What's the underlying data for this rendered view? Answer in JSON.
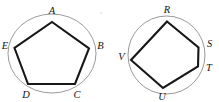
{
  "canvas": {
    "width": 219,
    "height": 102,
    "background": "#ffffff",
    "stroke_polygon": "#171717",
    "stroke_circle": "#8d8d8d",
    "label_color": "#141414"
  },
  "figures": [
    {
      "id": "left-figure",
      "name": "regular-pentagon-in-circle",
      "circle": {
        "cx": 52,
        "cy": 53.5,
        "rx": 44,
        "ry": 39.5
      },
      "polygon_points": "52,22 89,48.5 75,84 28,84 14.5,48",
      "vertices": [
        {
          "key": "A",
          "label": "A",
          "x": 52,
          "y": 22,
          "lx": 52,
          "ly": 11.5
        },
        {
          "key": "B",
          "label": "B",
          "x": 89,
          "y": 48.5,
          "lx": 100.5,
          "ly": 47
        },
        {
          "key": "C",
          "label": "C",
          "x": 75,
          "y": 84,
          "lx": 77,
          "ly": 95.5
        },
        {
          "key": "D",
          "label": "D",
          "x": 28,
          "y": 84,
          "lx": 26,
          "ly": 95.5
        },
        {
          "key": "E",
          "label": "E",
          "x": 14.5,
          "y": 48,
          "lx": 5,
          "ly": 47
        }
      ]
    },
    {
      "id": "right-figure",
      "name": "irregular-pentagon-in-circle",
      "circle": {
        "cx": 166.5,
        "cy": 55,
        "rx": 38.5,
        "ry": 39
      },
      "polygon_points": "167,21.5 198.5,47.5 198,66.5 163,88 131,60",
      "vertices": [
        {
          "key": "R",
          "label": "R",
          "x": 167,
          "y": 21.5,
          "lx": 167,
          "ly": 11
        },
        {
          "key": "S",
          "label": "S",
          "x": 198.5,
          "y": 47.5,
          "lx": 209.5,
          "ly": 45
        },
        {
          "key": "T",
          "label": "T",
          "x": 198,
          "y": 66.5,
          "lx": 209,
          "ly": 69
        },
        {
          "key": "U",
          "label": "U",
          "x": 163,
          "y": 88,
          "lx": 162,
          "ly": 97.5
        },
        {
          "key": "V",
          "label": "V",
          "x": 131,
          "y": 60,
          "lx": 121.5,
          "ly": 58
        }
      ]
    }
  ],
  "artifacts": [
    {
      "name": "scan-speck",
      "x": 100,
      "y": 12,
      "size": 2.4
    }
  ]
}
